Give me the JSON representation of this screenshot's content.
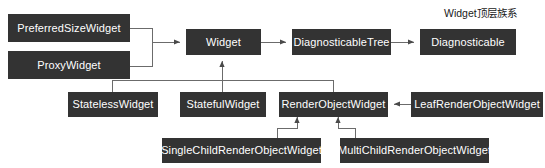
{
  "diagram": {
    "title": "Widget顶层族系",
    "title_position": {
      "x": 444,
      "y": 8
    },
    "canvas": {
      "width": 545,
      "height": 168
    },
    "colors": {
      "node_fill": "#333333",
      "node_text": "#ffffff",
      "edge": "#6b6b6b",
      "background": "#ffffff",
      "title_text": "#1a1a1a"
    },
    "nodes": [
      {
        "id": "preferred-size-widget",
        "label": "PreferredSizeWidget",
        "x": 8,
        "y": 14,
        "w": 122,
        "h": 28
      },
      {
        "id": "proxy-widget",
        "label": "ProxyWidget",
        "x": 8,
        "y": 51,
        "w": 122,
        "h": 28
      },
      {
        "id": "widget",
        "label": "Widget",
        "x": 186,
        "y": 29,
        "w": 75,
        "h": 26
      },
      {
        "id": "diagnosticable-tree",
        "label": "DiagnosticableTree",
        "x": 292,
        "y": 29,
        "w": 99,
        "h": 26
      },
      {
        "id": "diagnosticable",
        "label": "Diagnosticable",
        "x": 420,
        "y": 29,
        "w": 96,
        "h": 26
      },
      {
        "id": "stateless-widget",
        "label": "StatelessWidget",
        "x": 68,
        "y": 92,
        "w": 90,
        "h": 25
      },
      {
        "id": "stateful-widget",
        "label": "StatefulWidget",
        "x": 180,
        "y": 92,
        "w": 86,
        "h": 25
      },
      {
        "id": "render-object-widget",
        "label": "RenderObjectWidget",
        "x": 279,
        "y": 92,
        "w": 109,
        "h": 25
      },
      {
        "id": "leaf-render-object-widget",
        "label": "LeafRenderObjectWidget",
        "x": 411,
        "y": 92,
        "w": 132,
        "h": 25
      },
      {
        "id": "single-child-render-object-widget",
        "label": "SingleChildRenderObjectWidget",
        "x": 162,
        "y": 138,
        "w": 159,
        "h": 25
      },
      {
        "id": "multi-child-render-object-widget",
        "label": "MultiChildRenderObjectWidget",
        "x": 340,
        "y": 138,
        "w": 149,
        "h": 25
      }
    ],
    "edges": [
      {
        "from": "preferred-size-widget",
        "to": "widget"
      },
      {
        "from": "proxy-widget",
        "to": "widget"
      },
      {
        "from": "widget",
        "to": "diagnosticable-tree"
      },
      {
        "from": "diagnosticable-tree",
        "to": "diagnosticable"
      },
      {
        "from": "stateless-widget",
        "to": "widget"
      },
      {
        "from": "stateful-widget",
        "to": "widget"
      },
      {
        "from": "render-object-widget",
        "to": "widget"
      },
      {
        "from": "leaf-render-object-widget",
        "to": "render-object-widget"
      },
      {
        "from": "single-child-render-object-widget",
        "to": "render-object-widget"
      },
      {
        "from": "multi-child-render-object-widget",
        "to": "render-object-widget"
      }
    ]
  }
}
